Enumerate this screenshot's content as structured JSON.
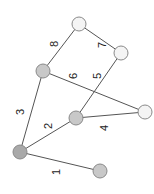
{
  "graph": {
    "nodes": [
      {
        "id": "A",
        "x": 20,
        "y": 152,
        "fill": "#a9a9a9"
      },
      {
        "id": "B",
        "x": 100,
        "y": 171,
        "fill": "#c8c8c8"
      },
      {
        "id": "C",
        "x": 43,
        "y": 71,
        "fill": "#c8c8c8"
      },
      {
        "id": "D",
        "x": 76,
        "y": 118,
        "fill": "#c8c8c8"
      },
      {
        "id": "E",
        "x": 145,
        "y": 112,
        "fill": "#f4f4f4"
      },
      {
        "id": "F",
        "x": 79,
        "y": 24,
        "fill": "#f4f4f4"
      },
      {
        "id": "G",
        "x": 121,
        "y": 53,
        "fill": "#f4f4f4"
      }
    ],
    "edges": [
      {
        "from": "A",
        "to": "B",
        "weight": "1",
        "lx": 57,
        "ly": 172
      },
      {
        "from": "A",
        "to": "D",
        "weight": "2",
        "lx": 49,
        "ly": 126
      },
      {
        "from": "A",
        "to": "C",
        "weight": "3",
        "lx": 21,
        "ly": 112
      },
      {
        "from": "D",
        "to": "E",
        "weight": "4",
        "lx": 105,
        "ly": 128
      },
      {
        "from": "D",
        "to": "G",
        "weight": "5",
        "lx": 98,
        "ly": 76
      },
      {
        "from": "C",
        "to": "E",
        "weight": "6",
        "lx": 74,
        "ly": 76
      },
      {
        "from": "F",
        "to": "G",
        "weight": "7",
        "lx": 103,
        "ly": 45
      },
      {
        "from": "C",
        "to": "F",
        "weight": "8",
        "lx": 55,
        "ly": 44
      }
    ],
    "node_radius": 7
  }
}
